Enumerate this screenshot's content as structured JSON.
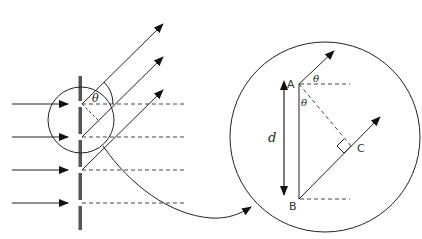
{
  "figure": {
    "title": "",
    "left_panel": {
      "description": "Diffraction grating with incident parallel rays and diffracted rays at angle theta",
      "angle_label": "θ",
      "incident_ray_count": 4,
      "diffracted_ray_count": 3
    },
    "right_panel": {
      "description": "Magnified view showing path difference geometry",
      "point_a": "A",
      "point_b": "B",
      "point_c": "C",
      "spacing_label": "d",
      "angle_label_top": "θ",
      "angle_label_inner": "θ"
    }
  },
  "colors": {
    "stroke": "#222222",
    "grating": "#555555",
    "dashed": "#444444",
    "background": "#ffffff"
  }
}
